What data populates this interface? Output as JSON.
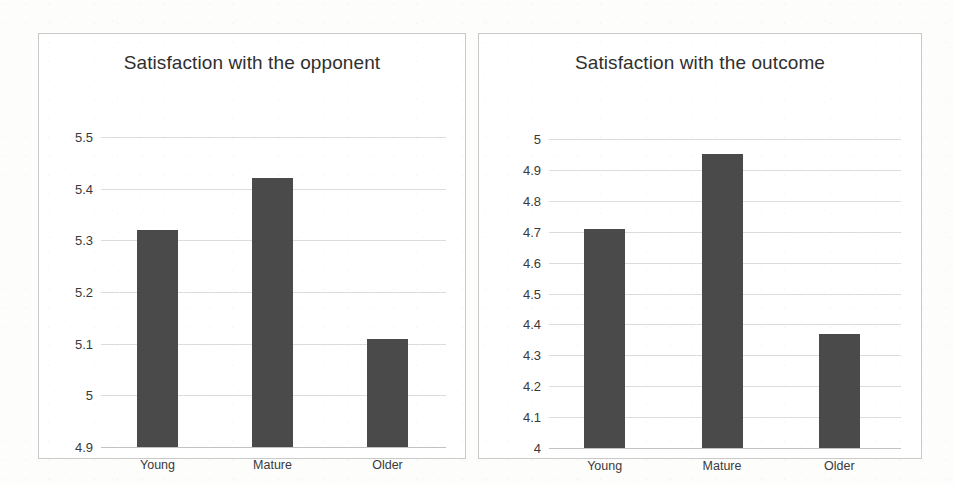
{
  "chart_data": [
    {
      "type": "bar",
      "id": "satisfaction-opponent",
      "title": "Satisfaction with the opponent",
      "xlabel": "",
      "ylabel": "",
      "categories": [
        "Young",
        "Mature",
        "Older"
      ],
      "values": [
        5.32,
        5.42,
        5.11
      ],
      "ylim": [
        4.9,
        5.5
      ],
      "yticks": [
        "4.9",
        "5",
        "5.1",
        "5.2",
        "5.3",
        "5.4",
        "5.5"
      ],
      "ytick_values": [
        4.9,
        5.0,
        5.1,
        5.2,
        5.3,
        5.4,
        5.5
      ],
      "grid": true,
      "legend": "none",
      "bar_color": "#4a4a4a"
    },
    {
      "type": "bar",
      "id": "satisfaction-outcome",
      "title": "Satisfaction with the outcome",
      "xlabel": "",
      "ylabel": "",
      "categories": [
        "Young",
        "Mature",
        "Older"
      ],
      "values": [
        4.71,
        4.95,
        4.37
      ],
      "ylim": [
        4.0,
        5.0
      ],
      "yticks": [
        "4",
        "4.1",
        "4.2",
        "4.3",
        "4.4",
        "4.5",
        "4.6",
        "4.7",
        "4.8",
        "4.9",
        "5"
      ],
      "ytick_values": [
        4.0,
        4.1,
        4.2,
        4.3,
        4.4,
        4.5,
        4.6,
        4.7,
        4.8,
        4.9,
        5.0
      ],
      "grid": true,
      "legend": "none",
      "bar_color": "#4a4a4a"
    }
  ],
  "colors": {
    "bar": "#4a4a4a",
    "gridline": "#dcdcdc",
    "panel_border": "#c9c9c9",
    "text": "#2f2f2f",
    "background": "#ffffff"
  }
}
